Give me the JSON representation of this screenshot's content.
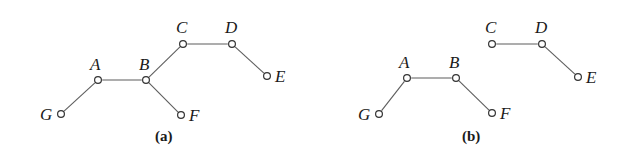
{
  "figure": {
    "background_color": "#ffffff",
    "edge_color": "#5d5d5d",
    "node_fill_color": "#ffffff",
    "node_stroke_color": "#333333",
    "label_color": "#1a1a1a",
    "width": 631,
    "height": 164
  },
  "panels": [
    {
      "id": "a",
      "caption": "(a)",
      "caption_x": 155,
      "caption_y": 128,
      "nodes": [
        {
          "label": "G",
          "x": 61,
          "y": 114,
          "label_x": 40,
          "label_y": 120
        },
        {
          "label": "A",
          "x": 98,
          "y": 80,
          "label_x": 90,
          "label_y": 70
        },
        {
          "label": "B",
          "x": 146,
          "y": 80,
          "label_x": 139,
          "label_y": 70
        },
        {
          "label": "C",
          "x": 183,
          "y": 44,
          "label_x": 176,
          "label_y": 33
        },
        {
          "label": "D",
          "x": 232,
          "y": 44,
          "label_x": 225,
          "label_y": 33
        },
        {
          "label": "E",
          "x": 267,
          "y": 76,
          "label_x": 275,
          "label_y": 82
        },
        {
          "label": "F",
          "x": 181,
          "y": 115,
          "label_x": 189,
          "label_y": 121
        }
      ],
      "edges": [
        {
          "from": "G",
          "to": "A"
        },
        {
          "from": "A",
          "to": "B"
        },
        {
          "from": "B",
          "to": "C"
        },
        {
          "from": "B",
          "to": "F"
        },
        {
          "from": "C",
          "to": "D"
        },
        {
          "from": "D",
          "to": "E"
        }
      ]
    },
    {
      "id": "b",
      "caption": "(b)",
      "caption_x": 462,
      "caption_y": 128,
      "nodes": [
        {
          "label": "G",
          "x": 379,
          "y": 114,
          "label_x": 358,
          "label_y": 120
        },
        {
          "label": "A",
          "x": 407,
          "y": 78,
          "label_x": 399,
          "label_y": 68
        },
        {
          "label": "B",
          "x": 456,
          "y": 78,
          "label_x": 449,
          "label_y": 68
        },
        {
          "label": "C",
          "x": 492,
          "y": 44,
          "label_x": 485,
          "label_y": 33
        },
        {
          "label": "D",
          "x": 542,
          "y": 44,
          "label_x": 535,
          "label_y": 33
        },
        {
          "label": "E",
          "x": 578,
          "y": 77,
          "label_x": 586,
          "label_y": 83
        },
        {
          "label": "F",
          "x": 492,
          "y": 113,
          "label_x": 500,
          "label_y": 119
        }
      ],
      "edges": [
        {
          "from": "G",
          "to": "A"
        },
        {
          "from": "A",
          "to": "B"
        },
        {
          "from": "B",
          "to": "F"
        },
        {
          "from": "C",
          "to": "D"
        },
        {
          "from": "D",
          "to": "E"
        }
      ]
    }
  ]
}
